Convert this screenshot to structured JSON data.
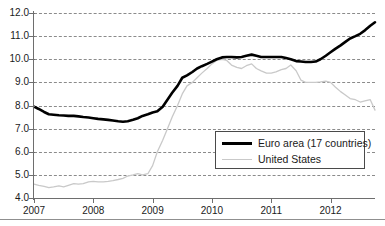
{
  "chart_data": {
    "type": "line",
    "title": "",
    "subtitle": "",
    "xlabel": "",
    "ylabel": "",
    "xlim": [
      2007.0,
      2012.75
    ],
    "ylim": [
      4.0,
      12.0
    ],
    "grid": "horizontal-dashed",
    "legend_position": "center-right-inside",
    "y_ticks": [
      "12.0",
      "11.0",
      "10.0",
      "9.0",
      "8.0",
      "7.0",
      "6.0",
      "5.0",
      "4.0"
    ],
    "y_tick_values": [
      12.0,
      11.0,
      10.0,
      9.0,
      8.0,
      7.0,
      6.0,
      5.0,
      4.0
    ],
    "x_ticks": [
      "2007",
      "2008",
      "2009",
      "2010",
      "2011",
      "2012"
    ],
    "x_tick_values": [
      2007,
      2008,
      2009,
      2010,
      2011,
      2012
    ],
    "series": [
      {
        "name": "Euro area (17 countries)",
        "color": "#000000",
        "line_width": 2.6,
        "x": [
          2007.0,
          2007.08,
          2007.17,
          2007.25,
          2007.33,
          2007.42,
          2007.5,
          2007.58,
          2007.67,
          2007.75,
          2007.83,
          2007.92,
          2008.0,
          2008.08,
          2008.17,
          2008.25,
          2008.33,
          2008.42,
          2008.5,
          2008.58,
          2008.67,
          2008.75,
          2008.83,
          2008.92,
          2009.0,
          2009.08,
          2009.17,
          2009.25,
          2009.33,
          2009.42,
          2009.5,
          2009.58,
          2009.67,
          2009.75,
          2009.83,
          2009.92,
          2010.0,
          2010.08,
          2010.17,
          2010.25,
          2010.33,
          2010.42,
          2010.5,
          2010.58,
          2010.67,
          2010.75,
          2010.83,
          2010.92,
          2011.0,
          2011.08,
          2011.17,
          2011.25,
          2011.33,
          2011.42,
          2011.5,
          2011.58,
          2011.67,
          2011.75,
          2011.83,
          2011.92,
          2012.0,
          2012.08,
          2012.17,
          2012.25,
          2012.33,
          2012.42,
          2012.5,
          2012.58,
          2012.67,
          2012.75
        ],
        "values": [
          7.95,
          7.85,
          7.72,
          7.62,
          7.6,
          7.58,
          7.57,
          7.55,
          7.55,
          7.53,
          7.5,
          7.48,
          7.45,
          7.42,
          7.4,
          7.38,
          7.35,
          7.32,
          7.3,
          7.32,
          7.38,
          7.45,
          7.55,
          7.62,
          7.7,
          7.75,
          7.95,
          8.25,
          8.55,
          8.85,
          9.2,
          9.3,
          9.45,
          9.6,
          9.7,
          9.8,
          9.9,
          10.0,
          10.08,
          10.1,
          10.1,
          10.08,
          10.1,
          10.15,
          10.2,
          10.15,
          10.1,
          10.1,
          10.1,
          10.1,
          10.1,
          10.05,
          10.0,
          9.92,
          9.9,
          9.88,
          9.88,
          9.9,
          10.0,
          10.15,
          10.3,
          10.45,
          10.6,
          10.75,
          10.9,
          11.0,
          11.1,
          11.25,
          11.45,
          11.6
        ]
      },
      {
        "name": "United States",
        "color": "#c9c9c9",
        "line_width": 1.3,
        "x": [
          2007.0,
          2007.08,
          2007.17,
          2007.25,
          2007.33,
          2007.42,
          2007.5,
          2007.58,
          2007.67,
          2007.75,
          2007.83,
          2007.92,
          2008.0,
          2008.08,
          2008.17,
          2008.25,
          2008.33,
          2008.42,
          2008.5,
          2008.58,
          2008.67,
          2008.75,
          2008.83,
          2008.92,
          2009.0,
          2009.08,
          2009.17,
          2009.25,
          2009.33,
          2009.42,
          2009.5,
          2009.58,
          2009.67,
          2009.75,
          2009.83,
          2009.92,
          2010.0,
          2010.08,
          2010.17,
          2010.25,
          2010.33,
          2010.42,
          2010.5,
          2010.58,
          2010.67,
          2010.75,
          2010.83,
          2010.92,
          2011.0,
          2011.08,
          2011.17,
          2011.25,
          2011.33,
          2011.42,
          2011.5,
          2011.58,
          2011.67,
          2011.75,
          2011.83,
          2011.92,
          2012.0,
          2012.08,
          2012.17,
          2012.25,
          2012.33,
          2012.42,
          2012.5,
          2012.58,
          2012.67,
          2012.75
        ],
        "values": [
          4.6,
          4.55,
          4.5,
          4.45,
          4.48,
          4.52,
          4.48,
          4.55,
          4.62,
          4.6,
          4.62,
          4.7,
          4.72,
          4.7,
          4.7,
          4.72,
          4.75,
          4.8,
          4.85,
          4.95,
          5.0,
          5.05,
          5.0,
          5.05,
          5.4,
          6.0,
          6.5,
          7.0,
          7.5,
          8.0,
          8.5,
          8.85,
          9.0,
          9.2,
          9.4,
          9.6,
          9.8,
          9.95,
          10.0,
          9.95,
          9.75,
          9.65,
          9.6,
          9.72,
          9.8,
          9.6,
          9.5,
          9.4,
          9.4,
          9.45,
          9.55,
          9.6,
          9.75,
          9.5,
          9.1,
          9.0,
          9.0,
          9.0,
          9.02,
          9.05,
          9.0,
          8.8,
          8.6,
          8.45,
          8.3,
          8.25,
          8.15,
          8.2,
          8.25,
          7.8
        ]
      }
    ]
  },
  "legend": {
    "items": [
      {
        "label": "Euro area (17 countries)",
        "swatch": "thick-black-line"
      },
      {
        "label": "United States",
        "swatch": "thin-gray-line"
      }
    ]
  },
  "colors": {
    "euro_line": "#000000",
    "us_line": "#c9c9c9",
    "grid": "#8b8b8b",
    "axis": "#6e6e6e",
    "text": "#1a1a1a",
    "background": "#ffffff"
  }
}
